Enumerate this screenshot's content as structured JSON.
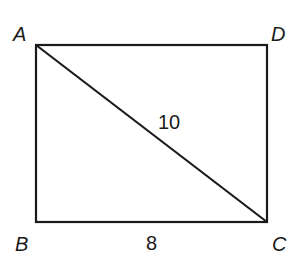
{
  "diagram": {
    "type": "rectangle-with-diagonal",
    "line_color": "#1a1a1a",
    "vertices": [
      {
        "name": "A",
        "x": 36,
        "y": 45
      },
      {
        "name": "D",
        "x": 267,
        "y": 45
      },
      {
        "name": "B",
        "x": 36,
        "y": 222
      },
      {
        "name": "C",
        "x": 267,
        "y": 222
      }
    ],
    "labels": {
      "A": "A",
      "B": "B",
      "C": "C",
      "D": "D",
      "side_BC": "8",
      "diagonal_AC": "10"
    }
  }
}
